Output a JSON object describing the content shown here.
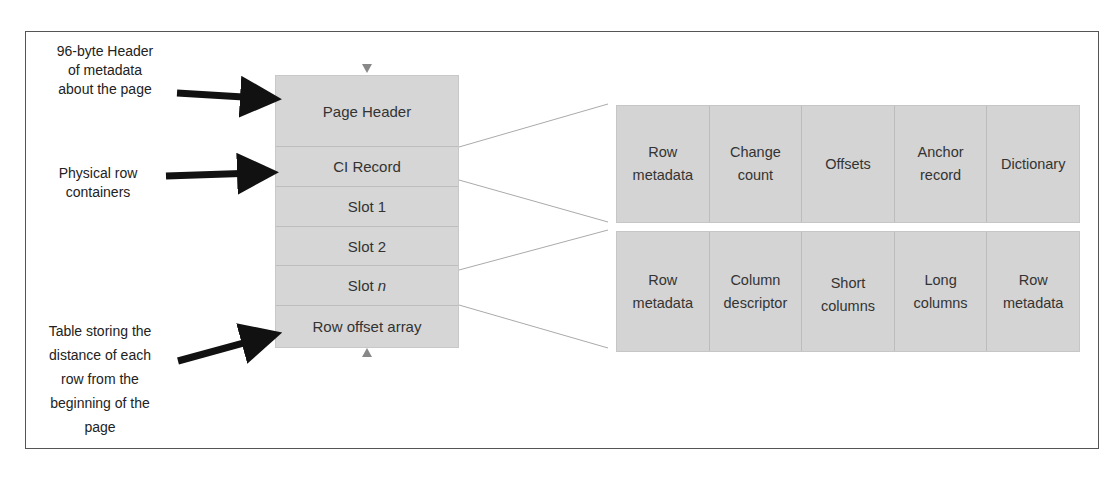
{
  "annotations": [
    {
      "id": "header-note",
      "lines": [
        "96-byte Header",
        "of metadata",
        "about the page"
      ]
    },
    {
      "id": "rows-note",
      "lines": [
        "Physical row",
        "containers"
      ]
    },
    {
      "id": "offset-note",
      "lines": [
        "Table storing the",
        "distance of each",
        "row from the",
        "beginning of the",
        "page"
      ]
    }
  ],
  "page": {
    "rows": [
      {
        "label": "Page Header"
      },
      {
        "label": "CI Record"
      },
      {
        "label": "Slot 1"
      },
      {
        "label": "Slot 2"
      },
      {
        "label": "Slot ",
        "label_italic": "n"
      },
      {
        "label": "Row offset array"
      }
    ]
  },
  "ci_record_table": {
    "cells": [
      {
        "lines": [
          "Row",
          "metadata"
        ]
      },
      {
        "lines": [
          "Change",
          "count"
        ]
      },
      {
        "lines": [
          "Offsets"
        ]
      },
      {
        "lines": [
          "Anchor",
          "record"
        ]
      },
      {
        "lines": [
          "Dictionary"
        ]
      }
    ]
  },
  "slot_table": {
    "cells": [
      {
        "lines": [
          "Row",
          "metadata"
        ]
      },
      {
        "lines": [
          "Column",
          "descriptor"
        ]
      },
      {
        "lines": [
          "Short",
          "columns"
        ]
      },
      {
        "lines": [
          "Long",
          "columns"
        ]
      },
      {
        "lines": [
          "Row",
          "metadata"
        ]
      }
    ]
  },
  "colors": {
    "box_fill": "#d6d6d6",
    "arrow": "#111111",
    "marker": "#888888",
    "connector": "#aaaaaa"
  }
}
